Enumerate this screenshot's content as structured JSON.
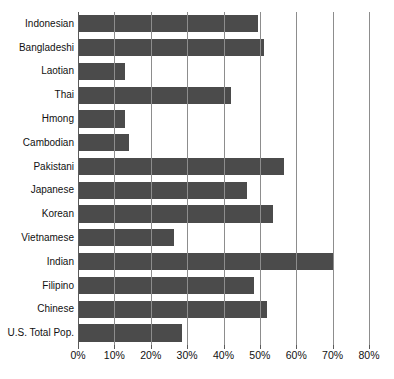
{
  "figure": {
    "clipped_title_fragment": "",
    "bar_color": "#4b4b4b",
    "grid_color": "#8d8d8d",
    "axis_color": "#5a5a5a",
    "background": "#ffffff"
  },
  "chart_data": {
    "type": "bar",
    "orientation": "horizontal",
    "title": "",
    "xlabel": "",
    "ylabel": "",
    "xlim": [
      0,
      80
    ],
    "grid": true,
    "legend": "none",
    "unit": "%",
    "categories": [
      "Indonesian",
      "Bangladeshi",
      "Laotian",
      "Thai",
      "Hmong",
      "Cambodian",
      "Pakistani",
      "Japanese",
      "Korean",
      "Vietnamese",
      "Indian",
      "Filipino",
      "Chinese",
      "U.S. Total Pop."
    ],
    "values": [
      49.5,
      51,
      13,
      42,
      13,
      14,
      56.5,
      46.5,
      53.5,
      26.5,
      70,
      48.5,
      52,
      28.5
    ],
    "xticks": [
      0,
      10,
      20,
      30,
      40,
      50,
      60,
      70,
      80
    ],
    "xticklabels": [
      "0%",
      "10%",
      "20%",
      "30%",
      "40%",
      "50%",
      "60%",
      "70%",
      "80%"
    ]
  }
}
